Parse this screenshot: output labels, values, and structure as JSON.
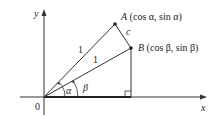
{
  "diagram": {
    "axes": {
      "x_label": "x",
      "y_label": "y",
      "origin_label": "0"
    },
    "points": {
      "A": {
        "name": "A",
        "coords": "(cos α, sin α)"
      },
      "B": {
        "name": "B",
        "coords": "(cos β, sin β)"
      }
    },
    "segments": {
      "OA_label": "1",
      "OB_label": "1",
      "AB_label": "c"
    },
    "angles": {
      "alpha": "α",
      "beta": "β"
    },
    "colors": {
      "stroke": "#333333",
      "text": "#222222"
    }
  }
}
